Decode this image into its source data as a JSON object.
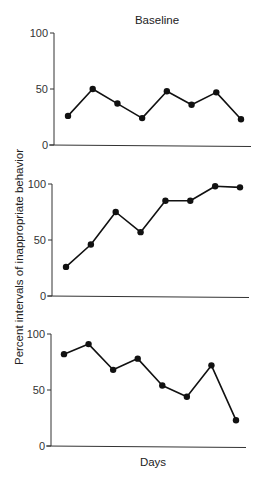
{
  "chart_data": [
    {
      "type": "line",
      "title": "Baseline",
      "xlabel": "",
      "ylabel": "",
      "ylim": [
        0,
        100
      ],
      "yticks": [
        "0",
        "50",
        "100"
      ],
      "grid": false,
      "series": [
        {
          "name": "Baseline",
          "x": [
            1,
            2,
            3,
            4,
            5,
            6,
            7,
            8
          ],
          "values": [
            26,
            50,
            37,
            24,
            48,
            36,
            47,
            23
          ]
        }
      ]
    },
    {
      "type": "line",
      "title": "",
      "xlabel": "",
      "ylabel": "",
      "ylim": [
        0,
        100
      ],
      "yticks": [
        "0",
        "50",
        "100"
      ],
      "grid": false,
      "series": [
        {
          "name": "Panel 2",
          "x": [
            1,
            2,
            3,
            4,
            5,
            6,
            7,
            8
          ],
          "values": [
            26,
            46,
            75,
            57,
            85,
            85,
            98,
            97
          ]
        }
      ]
    },
    {
      "type": "line",
      "title": "",
      "xlabel": "Days",
      "ylabel": "",
      "ylim": [
        0,
        100
      ],
      "yticks": [
        "0",
        "50",
        "100"
      ],
      "grid": false,
      "series": [
        {
          "name": "Panel 3",
          "x": [
            1,
            2,
            3,
            4,
            5,
            6,
            7,
            8
          ],
          "values": [
            82,
            91,
            68,
            78,
            54,
            44,
            72,
            23
          ]
        }
      ]
    }
  ],
  "shared_ylabel": "Percent intervals of inappropriate behavior"
}
